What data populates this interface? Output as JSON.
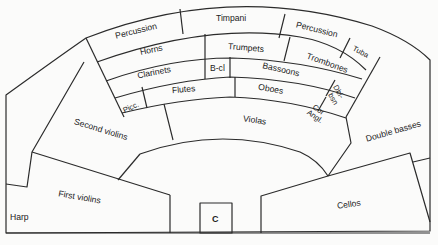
{
  "stage_sections": {
    "percussion_left": "Percussion",
    "timpani": "Timpani",
    "percussion_right": "Percussion",
    "tuba": "Tuba",
    "horns": "Horns",
    "trumpets": "Trumpets",
    "trombones": "Trombones",
    "clarinets": "Clarinets",
    "bass_clarinet": "B-cl",
    "bassoons": "Bassoons",
    "double_bassoon_line1": "Dbl-",
    "double_bassoon_line2": "bsn",
    "piccolo": "Picc.",
    "flutes": "Flutes",
    "oboes": "Oboes",
    "cor_anglais_line1": "Cor",
    "cor_anglais_line2": "Angl.",
    "violas": "Violas",
    "second_violins": "Second violins",
    "first_violins": "First violins",
    "harp": "Harp",
    "cellos": "Cellos",
    "double_basses": "Double basses",
    "conductor": "C"
  },
  "colors": {
    "line": "#2b2b2b",
    "background": "#fbfbfa",
    "text": "#222222"
  }
}
